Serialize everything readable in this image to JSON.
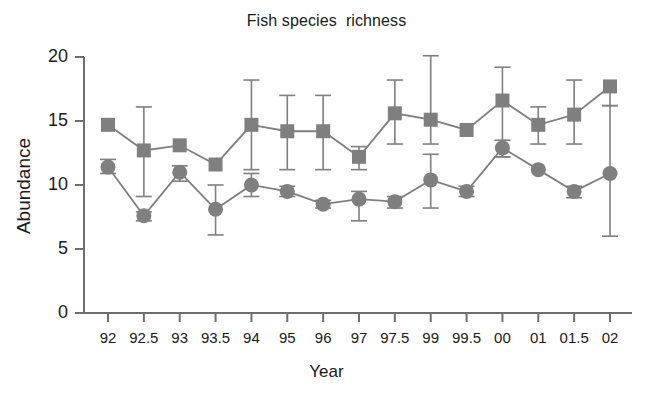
{
  "chart_data": {
    "type": "line",
    "title": "Fish species  richness",
    "xlabel": "Year",
    "ylabel": "Abundance",
    "categories": [
      "92",
      "92.5",
      "93",
      "93.5",
      "94",
      "95",
      "96",
      "97",
      "97.5",
      "99",
      "99.5",
      "00",
      "01",
      "01.5",
      "02"
    ],
    "ylim": [
      0,
      20
    ],
    "yticks": [
      "0",
      "5",
      "10",
      "15",
      "20"
    ],
    "ytick_values": [
      0,
      5,
      10,
      15,
      20
    ],
    "grid": false,
    "legend_position": "none",
    "series_color": "#7f7f7f",
    "axis_color": "#6e6e6e",
    "series": [
      {
        "name": "square-series",
        "marker": "square",
        "color": "#7f7f7f",
        "values": [
          14.7,
          12.7,
          13.1,
          11.6,
          14.7,
          14.2,
          14.2,
          12.2,
          15.6,
          15.1,
          14.3,
          16.6,
          14.7,
          15.5,
          17.7
        ],
        "err_low": [
          14.7,
          9.1,
          13.1,
          11.6,
          11.2,
          11.2,
          11.2,
          11.2,
          13.2,
          13.2,
          14.3,
          12.2,
          13.2,
          13.2,
          16.2
        ],
        "err_high": [
          14.7,
          16.1,
          13.1,
          11.6,
          18.2,
          17.0,
          17.0,
          13.0,
          18.2,
          20.1,
          14.3,
          19.2,
          16.1,
          18.2,
          17.7
        ]
      },
      {
        "name": "circle-series",
        "marker": "circle",
        "color": "#7f7f7f",
        "values": [
          11.4,
          7.6,
          11.0,
          8.1,
          10.0,
          9.5,
          8.5,
          8.9,
          8.7,
          10.4,
          9.5,
          12.9,
          11.2,
          9.5,
          10.9
        ],
        "err_low": [
          10.9,
          7.2,
          10.3,
          6.1,
          9.1,
          9.1,
          8.2,
          7.2,
          8.2,
          8.2,
          9.1,
          12.2,
          11.2,
          9.0,
          6.0
        ],
        "err_high": [
          12.0,
          7.9,
          11.5,
          10.0,
          10.9,
          9.9,
          8.8,
          9.5,
          9.1,
          12.4,
          9.9,
          13.5,
          11.2,
          9.9,
          16.2
        ]
      }
    ]
  }
}
